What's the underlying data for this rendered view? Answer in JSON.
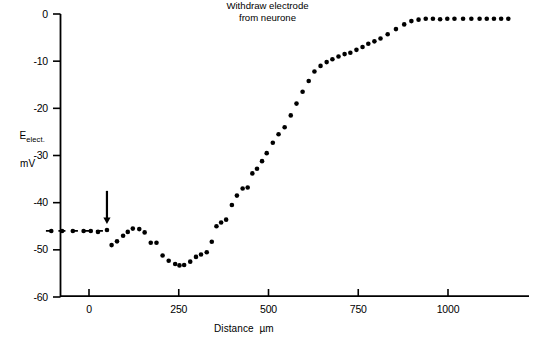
{
  "chart_data": {
    "type": "scatter",
    "title": "",
    "xlabel": "Distance  µm",
    "ylabel_main": "E",
    "ylabel_sub": "elect.",
    "ylabel_units": "mV",
    "xlim": [
      -120,
      1200
    ],
    "ylim": [
      -60,
      0
    ],
    "xticks": [
      0,
      250,
      500,
      750,
      1000
    ],
    "xtick_labels": [
      "0",
      "250",
      "500",
      "750",
      "1000"
    ],
    "yticks": [
      0,
      -10,
      -20,
      -30,
      -40,
      -50,
      -60
    ],
    "ytick_labels": [
      "0",
      "-10",
      "-20",
      "-30",
      "-40",
      "-50",
      "-60"
    ],
    "grid": false,
    "legend": null,
    "marker": "filled-circle",
    "marker_color": "#000000",
    "marker_size_px": 4.6,
    "reference_line": {
      "style": "dashed",
      "y_value": -46,
      "x_start": -120,
      "x_end": 55,
      "color": "#000000"
    },
    "annotations": [
      {
        "name": "withdraw-electrode-arrow",
        "text_line1": "Withdraw electrode",
        "text_line2": "from neurone",
        "arrow_x": 50,
        "arrow_y_from": -37.5,
        "arrow_y_to": -44.5,
        "direction": "down"
      }
    ],
    "x": [
      -105,
      -75,
      -45,
      -15,
      5,
      25,
      50,
      63,
      78,
      95,
      108,
      122,
      140,
      155,
      172,
      188,
      205,
      222,
      240,
      252,
      265,
      282,
      298,
      312,
      328,
      342,
      355,
      368,
      382,
      398,
      412,
      428,
      442,
      455,
      468,
      482,
      495,
      512,
      528,
      545,
      562,
      578,
      595,
      612,
      628,
      645,
      662,
      678,
      695,
      712,
      728,
      745,
      762,
      778,
      795,
      812,
      832,
      855,
      878,
      898,
      918,
      938,
      958,
      978,
      998,
      1018,
      1042,
      1065,
      1088,
      1108,
      1128,
      1148,
      1168
    ],
    "y": [
      -46.0,
      -46.0,
      -46.0,
      -46.0,
      -46.0,
      -46.2,
      -45.8,
      -49.0,
      -48.2,
      -47.0,
      -46.2,
      -45.5,
      -45.6,
      -46.3,
      -48.5,
      -48.5,
      -51.2,
      -52.3,
      -53.0,
      -53.3,
      -53.2,
      -52.5,
      -51.5,
      -51.0,
      -50.5,
      -48.3,
      -45.0,
      -44.2,
      -43.6,
      -40.5,
      -38.5,
      -37.0,
      -36.8,
      -33.8,
      -32.8,
      -31.2,
      -29.5,
      -27.3,
      -25.5,
      -24.0,
      -21.5,
      -19.0,
      -16.5,
      -14.2,
      -12.2,
      -11.0,
      -10.2,
      -9.6,
      -9.0,
      -8.5,
      -8.2,
      -7.6,
      -7.0,
      -6.3,
      -5.8,
      -5.2,
      -4.3,
      -3.2,
      -2.2,
      -1.5,
      -1.2,
      -1.0,
      -1.0,
      -1.1,
      -1.0,
      -1.0,
      -1.0,
      -1.0,
      -1.0,
      -1.0,
      -1.0,
      -1.0,
      -1.0
    ]
  }
}
